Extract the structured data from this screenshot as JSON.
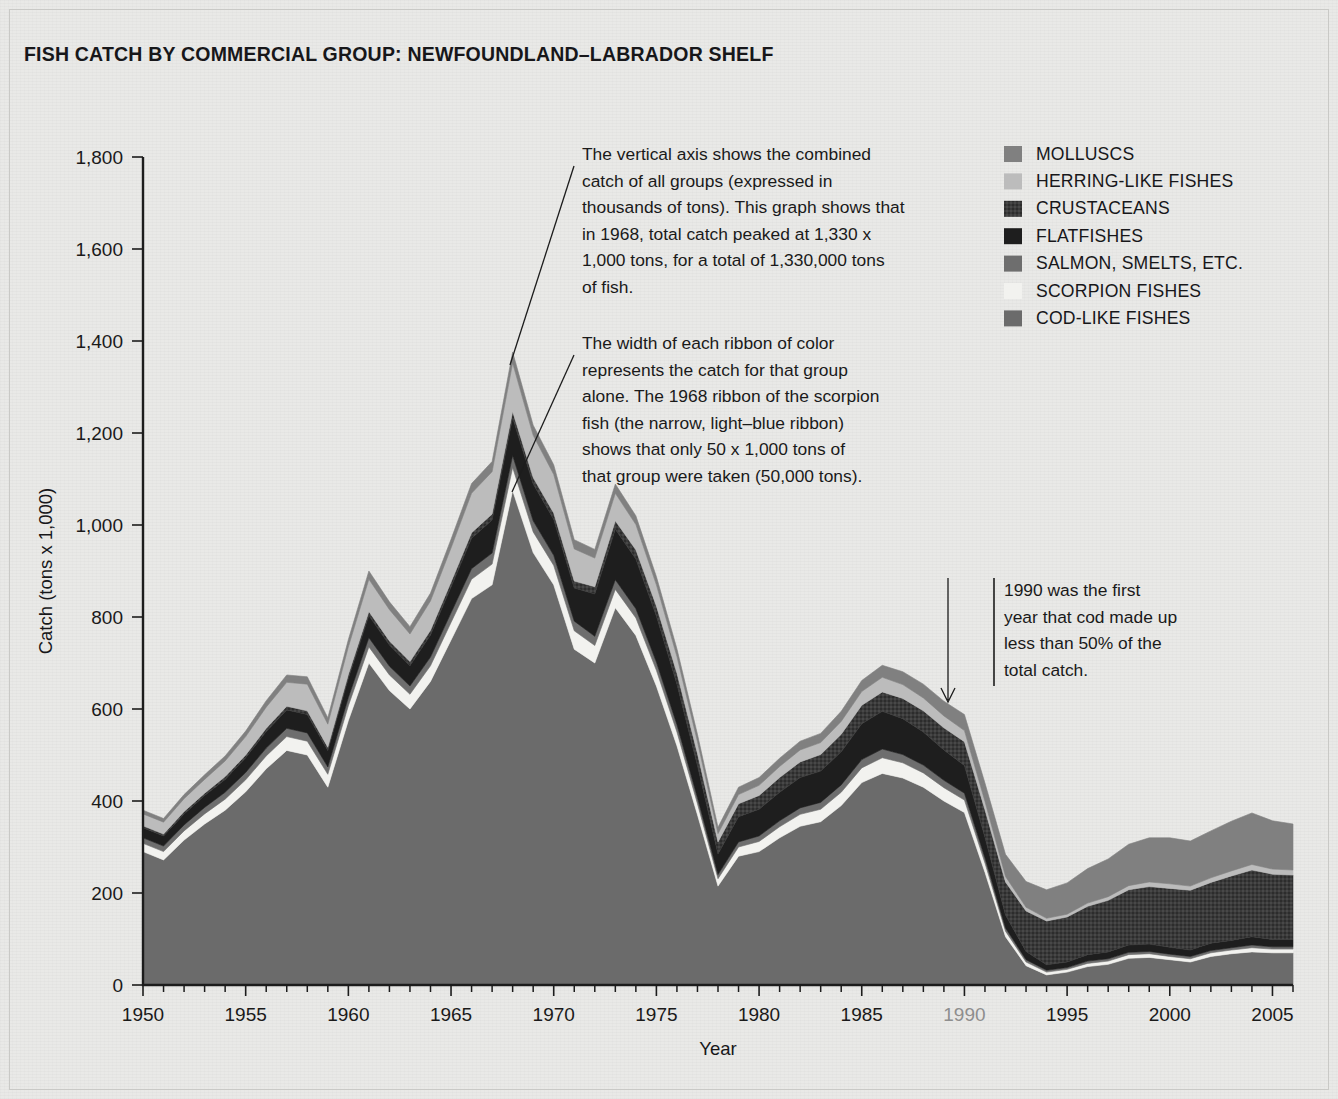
{
  "title": "FISH CATCH BY COMMERCIAL GROUP: NEWFOUNDLAND–LABRADOR SHELF",
  "axis": {
    "ylabel": "Catch (tons x 1,000)",
    "xlabel": "Year",
    "yticks": [
      "0",
      "200",
      "400",
      "600",
      "800",
      "1,000",
      "1,200",
      "1,400",
      "1,600",
      "1,800"
    ],
    "xticks": [
      "1950",
      "1955",
      "1960",
      "1965",
      "1970",
      "1975",
      "1980",
      "1985",
      "1990",
      "1995",
      "2000",
      "2005"
    ],
    "dim_xtick": "1990"
  },
  "legend": {
    "items": [
      {
        "label": "MOLLUSCS",
        "color": "#808080"
      },
      {
        "label": "HERRING-LIKE FISHES",
        "color": "#bcbcbc"
      },
      {
        "label": "CRUSTACEANS",
        "color": "#3a3a3a"
      },
      {
        "label": "FLATFISHES",
        "color": "#1e1e1e"
      },
      {
        "label": "SALMON, SMELTS, ETC.",
        "color": "#6e6e6e"
      },
      {
        "label": "SCORPION FISHES",
        "color": "#f2f2ef"
      },
      {
        "label": "COD-LIKE FISHES",
        "color": "#6b6b6b"
      }
    ]
  },
  "annotations": [
    {
      "name": "annotation-total-catch",
      "lines": [
        "The vertical axis shows the combined",
        "catch of all groups (expressed in",
        "thousands of tons). This graph shows that",
        "in 1968, total catch peaked at 1,330 x",
        "1,000 tons, for a total of 1,330,000 tons",
        "of fish."
      ]
    },
    {
      "name": "annotation-ribbon-width",
      "lines": [
        "The width of each ribbon of color",
        "represents the catch for that group",
        "alone. The 1968 ribbon of the scorpion",
        "fish (the narrow, light–blue ribbon)",
        "shows that only 50 x 1,000 tons of",
        "that group were taken (50,000 tons)."
      ]
    },
    {
      "name": "annotation-1990-cod",
      "lines": [
        "1990 was the first",
        "year that cod made up",
        "less than 50% of the",
        "total catch."
      ]
    }
  ],
  "chart_data": {
    "type": "area",
    "title": "FISH CATCH BY COMMERCIAL GROUP: NEWFOUNDLAND–LABRADOR SHELF",
    "xlabel": "Year",
    "ylabel": "Catch (tons x 1,000)",
    "xlim": [
      1950,
      2006
    ],
    "ylim": [
      0,
      1800
    ],
    "grid": false,
    "legend_position": "top-right",
    "stack_order_bottom_to_top": [
      "COD-LIKE FISHES",
      "SCORPION FISHES",
      "SALMON, SMELTS, ETC.",
      "FLATFISHES",
      "CRUSTACEANS",
      "HERRING-LIKE FISHES",
      "MOLLUSCS"
    ],
    "x": [
      1950,
      1951,
      1952,
      1953,
      1954,
      1955,
      1956,
      1957,
      1958,
      1959,
      1960,
      1961,
      1962,
      1963,
      1964,
      1965,
      1966,
      1967,
      1968,
      1969,
      1970,
      1971,
      1972,
      1973,
      1974,
      1975,
      1976,
      1977,
      1978,
      1979,
      1980,
      1981,
      1982,
      1983,
      1984,
      1985,
      1986,
      1987,
      1988,
      1989,
      1990,
      1991,
      1992,
      1993,
      1994,
      1995,
      1996,
      1997,
      1998,
      1999,
      2000,
      2001,
      2002,
      2003,
      2004,
      2005,
      2006
    ],
    "series": [
      {
        "name": "COD-LIKE FISHES",
        "color": "#6b6b6b",
        "values": [
          290,
          272,
          315,
          350,
          380,
          420,
          470,
          510,
          500,
          430,
          575,
          700,
          640,
          600,
          660,
          750,
          840,
          870,
          1075,
          940,
          870,
          730,
          700,
          820,
          760,
          650,
          520,
          370,
          215,
          280,
          290,
          320,
          345,
          355,
          390,
          440,
          460,
          450,
          430,
          400,
          375,
          245,
          105,
          42,
          22,
          28,
          40,
          45,
          58,
          60,
          55,
          50,
          62,
          68,
          72,
          70,
          70
        ]
      },
      {
        "name": "SCORPION FISHES",
        "color": "#f2f2ef",
        "values": [
          18,
          18,
          20,
          22,
          24,
          26,
          28,
          30,
          30,
          28,
          32,
          35,
          34,
          32,
          34,
          38,
          42,
          45,
          50,
          45,
          42,
          40,
          38,
          40,
          38,
          34,
          30,
          24,
          16,
          20,
          22,
          24,
          26,
          27,
          29,
          32,
          34,
          33,
          31,
          29,
          27,
          20,
          12,
          8,
          6,
          6,
          7,
          7,
          8,
          8,
          7,
          7,
          8,
          8,
          9,
          8,
          8
        ]
      },
      {
        "name": "SALMON, SMELTS, ETC.",
        "color": "#6e6e6e",
        "values": [
          12,
          12,
          13,
          14,
          15,
          16,
          17,
          18,
          18,
          16,
          18,
          20,
          19,
          18,
          19,
          21,
          23,
          24,
          26,
          24,
          22,
          21,
          20,
          21,
          20,
          18,
          16,
          13,
          9,
          11,
          12,
          13,
          14,
          15,
          16,
          18,
          19,
          18,
          17,
          16,
          15,
          11,
          7,
          5,
          4,
          4,
          5,
          5,
          5,
          5,
          5,
          5,
          5,
          5,
          6,
          5,
          5
        ]
      },
      {
        "name": "FLATFISHES",
        "color": "#1e1e1e",
        "values": [
          22,
          22,
          24,
          26,
          28,
          32,
          36,
          40,
          40,
          36,
          42,
          48,
          46,
          44,
          48,
          56,
          66,
          72,
          82,
          80,
          78,
          72,
          92,
          110,
          108,
          100,
          88,
          70,
          45,
          55,
          58,
          62,
          66,
          68,
          72,
          78,
          82,
          78,
          72,
          66,
          60,
          45,
          28,
          18,
          12,
          12,
          14,
          15,
          16,
          16,
          15,
          14,
          16,
          16,
          18,
          16,
          16
        ]
      },
      {
        "name": "CRUSTACEANS",
        "color": "#3a3a3a",
        "values": [
          4,
          4,
          5,
          5,
          6,
          6,
          7,
          8,
          8,
          7,
          8,
          9,
          9,
          9,
          10,
          11,
          12,
          13,
          14,
          14,
          14,
          15,
          16,
          18,
          20,
          22,
          24,
          26,
          26,
          28,
          30,
          32,
          34,
          36,
          38,
          40,
          42,
          44,
          46,
          48,
          52,
          60,
          72,
          88,
          95,
          98,
          105,
          112,
          120,
          125,
          128,
          130,
          132,
          140,
          145,
          142,
          140
        ]
      },
      {
        "name": "HERRING-LIKE FISHES",
        "color": "#bcbcbc",
        "values": [
          26,
          26,
          28,
          30,
          34,
          40,
          46,
          52,
          58,
          50,
          60,
          70,
          68,
          60,
          64,
          74,
          86,
          92,
          105,
          92,
          84,
          70,
          62,
          60,
          55,
          46,
          36,
          26,
          18,
          20,
          22,
          24,
          26,
          26,
          28,
          30,
          32,
          30,
          28,
          26,
          24,
          18,
          12,
          8,
          6,
          6,
          7,
          8,
          9,
          10,
          10,
          9,
          10,
          11,
          12,
          11,
          11
        ]
      },
      {
        "name": "MOLLUSCS",
        "color": "#808080",
        "values": [
          8,
          8,
          9,
          10,
          11,
          12,
          14,
          16,
          16,
          14,
          16,
          18,
          17,
          16,
          17,
          19,
          21,
          22,
          24,
          22,
          21,
          20,
          19,
          20,
          19,
          18,
          17,
          16,
          14,
          16,
          17,
          18,
          19,
          20,
          22,
          24,
          26,
          28,
          30,
          32,
          35,
          40,
          48,
          56,
          62,
          68,
          75,
          82,
          90,
          96,
          100,
          98,
          102,
          108,
          112,
          105,
          100
        ]
      }
    ],
    "notes": {
      "peak_year": 1968,
      "peak_total": 1330,
      "scorpion_1968": 50
    }
  }
}
